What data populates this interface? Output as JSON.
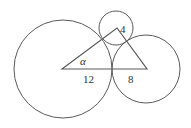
{
  "diagram": {
    "stroke_color": "#555555",
    "labels": {
      "angle": "α",
      "left_base": "12",
      "right_base": "8",
      "top_side": "4"
    },
    "circles": [
      {
        "name": "large",
        "cx": 63,
        "cy": 69,
        "r": 49
      },
      {
        "name": "small",
        "cx": 116,
        "cy": 28,
        "r": 17
      },
      {
        "name": "medium",
        "cx": 146,
        "cy": 69,
        "r": 34
      }
    ],
    "triangle": {
      "vertices": [
        [
          62,
          69
        ],
        [
          117,
          28
        ],
        [
          147,
          69
        ]
      ]
    }
  }
}
